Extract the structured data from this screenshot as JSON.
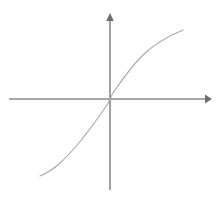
{
  "figure": {
    "title": "",
    "background_color": "#ffffff",
    "width": 222,
    "height": 200
  },
  "axes": {
    "origin": {
      "x": 110,
      "y": 99
    },
    "color": "#8a8a8a",
    "arrow_color": "#6e6e6e",
    "x_axis": {
      "label": "",
      "start_px": 9,
      "end_px": 212,
      "has_arrow_positive": true,
      "has_arrow_negative": false,
      "ticks": [],
      "tick_labels": []
    },
    "y_axis": {
      "label": "",
      "start_px": 190,
      "end_px": 13,
      "has_arrow_positive": true,
      "has_arrow_negative": false,
      "ticks": [],
      "tick_labels": []
    }
  },
  "curve": {
    "name": "odd-increasing-curve",
    "color": "#a9a9a9",
    "stroke_width": 1.15,
    "description": "cube-root shaped odd function through origin",
    "path": "M 40,176 C 55,170 66,158 78,144 C 88,132 98,118 105,108 C 108,104 109,101 110,99 C 111,97 112,94 115,90 C 122,80 132,66 142,56 C 152,46 166,37 183,30"
  },
  "chart_data": {
    "type": "line",
    "title": "",
    "subtitle": "",
    "xlabel": "",
    "ylabel": "",
    "grid": false,
    "legend": false,
    "legend_position": "none",
    "xlim": [
      -3.5,
      3.5
    ],
    "ylim": [
      -2.6,
      2.6
    ],
    "series": [
      {
        "name": "y = cbrt(x)",
        "color": "#a9a9a9",
        "x": [
          -2.6,
          -2.2,
          -1.8,
          -1.4,
          -1.0,
          -0.6,
          -0.3,
          -0.1,
          0.0,
          0.1,
          0.3,
          0.6,
          1.0,
          1.4,
          1.8,
          2.2,
          2.6,
          3.0
        ],
        "y": [
          -1.52,
          -1.44,
          -1.35,
          -1.24,
          -1.1,
          -0.92,
          -0.73,
          -0.5,
          0.0,
          0.5,
          0.73,
          0.92,
          1.1,
          1.24,
          1.35,
          1.44,
          1.52,
          1.6
        ]
      }
    ],
    "annotations": []
  }
}
